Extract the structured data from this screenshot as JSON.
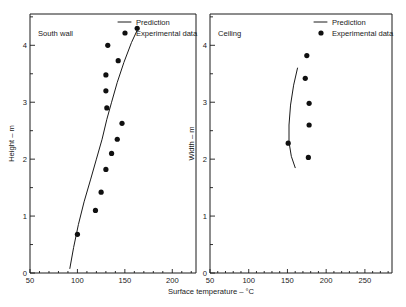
{
  "figure": {
    "x_axis_label": "Surface temperature – °C",
    "background": "#ffffff",
    "ink_color": "#1a1a1a"
  },
  "legend": {
    "prediction_label": "Prediction",
    "experimental_label": "Experimental data"
  },
  "panels": [
    {
      "id": "south-wall",
      "title": "South wall",
      "y_axis_label": "Height – m",
      "x_ticks": [
        "50",
        "100",
        "150",
        "200"
      ],
      "y_ticks": [
        "0",
        "1",
        "2",
        "3",
        "4"
      ]
    },
    {
      "id": "ceiling",
      "title": "Ceiling",
      "y_axis_label": "Width – m",
      "x_ticks": [
        "50",
        "100",
        "150",
        "200",
        "250"
      ],
      "y_ticks": [
        "0",
        "1",
        "2",
        "3",
        "4"
      ]
    }
  ],
  "chart_data": [
    {
      "type": "scatter",
      "panel": "South wall",
      "title": "South wall",
      "xlabel": "Surface temperature – °C",
      "ylabel": "Height – m",
      "xlim": [
        50,
        225
      ],
      "ylim": [
        0,
        4.55
      ],
      "xticks": [
        50,
        100,
        150,
        200
      ],
      "yticks": [
        0,
        1,
        2,
        3,
        4
      ],
      "minor_yticks": [
        0.5,
        1.5,
        2.5,
        3.5,
        4.5
      ],
      "grid": false,
      "legend_position": "top-right",
      "series": [
        {
          "name": "Prediction",
          "style": "line",
          "x": [
            92,
            96,
            101,
            107,
            114,
            120,
            126,
            131,
            136,
            142,
            149,
            157,
            164
          ],
          "y": [
            0.08,
            0.45,
            0.85,
            1.25,
            1.65,
            2.0,
            2.35,
            2.7,
            3.0,
            3.35,
            3.7,
            4.05,
            4.3
          ]
        },
        {
          "name": "Experimental data",
          "style": "points",
          "x": [
            100,
            119,
            125,
            130,
            136,
            142,
            147,
            131,
            130,
            130,
            132,
            143,
            163
          ],
          "y": [
            0.68,
            1.1,
            1.42,
            1.82,
            2.1,
            2.35,
            2.63,
            2.9,
            3.2,
            3.48,
            4.0,
            3.73,
            4.3
          ]
        }
      ]
    },
    {
      "type": "scatter",
      "panel": "Ceiling",
      "title": "Ceiling",
      "xlabel": "Surface temperature – °C",
      "ylabel": "Width – m",
      "xlim": [
        50,
        285
      ],
      "ylim": [
        0,
        4.55
      ],
      "xticks": [
        50,
        100,
        150,
        200,
        250
      ],
      "yticks": [
        0,
        1,
        2,
        3,
        4
      ],
      "minor_yticks": [
        0.5,
        1.5,
        2.5,
        3.5,
        4.5
      ],
      "grid": false,
      "legend_position": "top-right",
      "series": [
        {
          "name": "Prediction",
          "style": "line",
          "x": [
            163,
            158,
            154,
            152,
            152,
            155,
            160
          ],
          "y": [
            3.6,
            3.3,
            2.95,
            2.6,
            2.3,
            2.05,
            1.85
          ]
        },
        {
          "name": "Experimental data",
          "style": "points",
          "x": [
            175,
            173,
            178,
            178,
            151,
            177
          ],
          "y": [
            3.82,
            3.42,
            2.98,
            2.6,
            2.28,
            2.03
          ]
        }
      ]
    }
  ]
}
